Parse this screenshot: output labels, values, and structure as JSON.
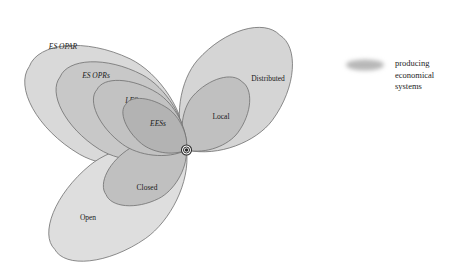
{
  "figure": {
    "background": "#ffffff",
    "hub": {
      "cx": 186.5,
      "cy": 150.0,
      "label": "origin-node"
    },
    "stroke_color": "#6f6f6f",
    "text_color": "#1a1a1a"
  },
  "petals": [
    {
      "id": "es-opar",
      "label": "ES OPAR",
      "italic": true,
      "group": "upper-left",
      "fill": "#d9d9d9",
      "angle_deg": 208,
      "length": 178,
      "width": 108,
      "label_x": 63,
      "label_y": 47,
      "z": 1
    },
    {
      "id": "es-oprs",
      "label": "ES OPRs",
      "italic": true,
      "group": "upper-left",
      "fill": "#c8c8c8",
      "angle_deg": 210,
      "length": 146,
      "width": 86,
      "label_x": 96,
      "label_y": 76,
      "z": 2
    },
    {
      "id": "less",
      "label": "LESs",
      "italic": true,
      "group": "upper-left",
      "fill": "#c2c2c2",
      "angle_deg": 214,
      "length": 108,
      "width": 62,
      "label_x": 133,
      "label_y": 101,
      "z": 3
    },
    {
      "id": "eess",
      "label": "EESs",
      "italic": true,
      "group": "upper-left",
      "fill": "#b3b3b3",
      "angle_deg": 217,
      "length": 76,
      "width": 44,
      "label_x": 158,
      "label_y": 124,
      "z": 4
    },
    {
      "id": "distributed",
      "label": "Distributed",
      "italic": false,
      "group": "right",
      "fill": "#d5d5d5",
      "angle_deg": 309,
      "length": 148,
      "width": 96,
      "label_x": 268,
      "label_y": 79,
      "z": 1
    },
    {
      "id": "local",
      "label": "Local",
      "italic": false,
      "group": "right",
      "fill": "#c0c0c0",
      "angle_deg": 309,
      "length": 88,
      "width": 58,
      "label_x": 221,
      "label_y": 117,
      "z": 2
    },
    {
      "id": "open",
      "label": "Open",
      "italic": false,
      "group": "lower-left",
      "fill": "#dedede",
      "angle_deg": 143,
      "length": 165,
      "width": 92,
      "label_x": 88,
      "label_y": 218,
      "z": 1
    },
    {
      "id": "closed",
      "label": "Closed",
      "italic": false,
      "group": "lower-left",
      "fill": "#c0c0c0",
      "angle_deg": 151,
      "length": 92,
      "width": 58,
      "label_x": 147,
      "label_y": 188,
      "z": 2
    }
  ],
  "legend": {
    "swatch": {
      "name": "producing-economical-systems-swatch",
      "cx": 365,
      "cy": 65,
      "rx": 19,
      "ry": 5.5,
      "fill": "#b8b8b8"
    },
    "lines": [
      "producing",
      "economical",
      "systems"
    ],
    "text_x": 395,
    "text_y": 58
  }
}
